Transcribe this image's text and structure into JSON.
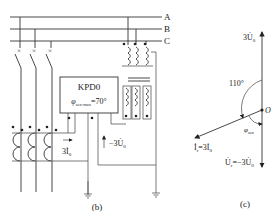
{
  "circuit": {
    "bus_labels": [
      "A",
      "B",
      "C"
    ],
    "relay_name": "KPD0",
    "relay_setting": "φsen·max=70°",
    "relay_setting_base": "φ",
    "relay_setting_sub": "sen·max",
    "relay_setting_value": "=70°",
    "current_label_base": "3İ",
    "current_label_sub": "0",
    "voltage_label_base": "−3U̇",
    "voltage_label_sub": "0",
    "caption": "(b)"
  },
  "phasor": {
    "top_label_base": "3U̇",
    "top_label_sub": "0",
    "angle_label": "110°",
    "origin_label": "O",
    "phi_label_base": "φ",
    "phi_label_sub": "sen",
    "current_label": "İr=3İ0",
    "current_label_base": "İ",
    "current_label_sub1": "r",
    "current_label_mid": "=3İ",
    "current_label_sub2": "0",
    "voltage_label": "U̇r=−3U̇0",
    "voltage_label_base": "U̇",
    "voltage_label_sub1": "r",
    "voltage_label_mid": "=−3U̇",
    "voltage_label_sub2": "0",
    "caption": "(c)"
  }
}
